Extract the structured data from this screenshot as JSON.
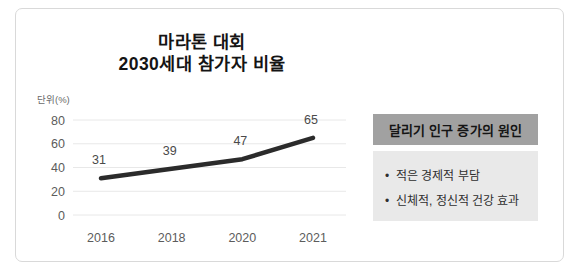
{
  "chart_data": {
    "type": "line",
    "title_line1": "마라톤 대회",
    "title_line2": "2030세대 참가자 비율",
    "unit_label": "단위(%)",
    "categories": [
      "2016",
      "2018",
      "2020",
      "2021"
    ],
    "values": [
      31,
      39,
      47,
      65
    ],
    "y_ticks": [
      0,
      20,
      40,
      60,
      80
    ],
    "ylim": [
      0,
      80
    ],
    "grid": true,
    "legend": "none",
    "line_color": "#2b2b2b",
    "grid_color": "#e8e8e8",
    "tick_color": "#5c5c5c",
    "value_label_color": "#4a4a4a"
  },
  "side_panel": {
    "header": "달리기 인구 증가의 원인",
    "bullets": [
      "적은 경제적 부담",
      "신체적, 정신적 건강 효과"
    ],
    "header_bg": "#a1a1a1",
    "body_bg": "#e9e9e9"
  }
}
